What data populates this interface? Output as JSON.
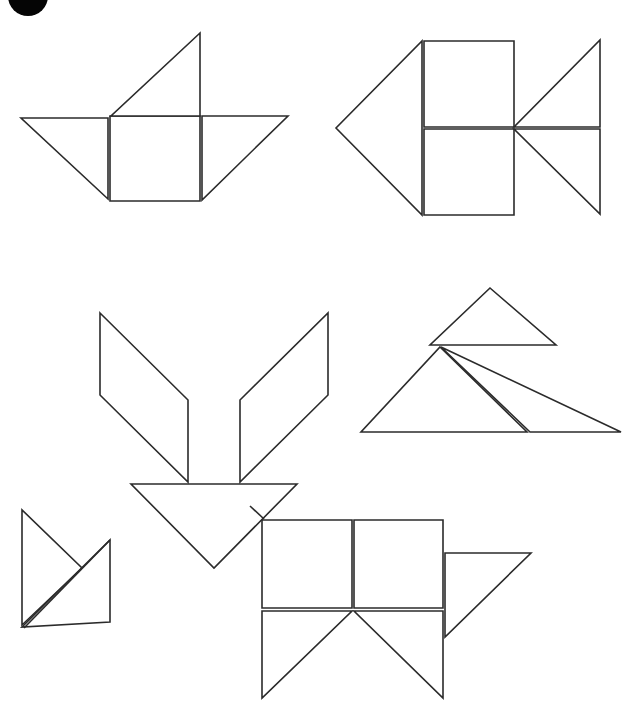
{
  "page": {
    "background_color": "#ffffff",
    "stroke_color": "#2b2b2b",
    "fill_color": "#ffffff",
    "width": 639,
    "height": 702
  },
  "logo": {
    "name": "corner-dot-logo",
    "shape": "circle",
    "color": "#050505",
    "cx": 28,
    "cy": -4,
    "r": 20
  },
  "figures": [
    {
      "id": "figure-top-left",
      "label": "Boat / windmill tangram figure",
      "pieces": [
        {
          "name": "large-triangle-left",
          "type": "triangle",
          "points": "21,118 108,118 108,199"
        },
        {
          "name": "center-square",
          "type": "square",
          "points": "110,116 200,116 200,201 110,201"
        },
        {
          "name": "large-triangle-top",
          "type": "triangle",
          "points": "111,116 200,116 200,33"
        },
        {
          "name": "large-triangle-right",
          "type": "triangle",
          "points": "202,116 288,116 202,200"
        }
      ]
    },
    {
      "id": "figure-top-right",
      "label": "Fish / arrow tangram figure",
      "pieces": [
        {
          "name": "large-triangle-left",
          "type": "triangle",
          "points": "422,41 422,215 336,128"
        },
        {
          "name": "square-upper",
          "type": "square",
          "points": "424,41 514,41 514,127 424,127"
        },
        {
          "name": "square-lower",
          "type": "square",
          "points": "424,129 514,129 514,215 424,215"
        },
        {
          "name": "large-triangle-upper-right",
          "type": "triangle",
          "points": "514,127 600,127 600,40"
        },
        {
          "name": "large-triangle-lower-right",
          "type": "triangle",
          "points": "514,129 600,129 600,214"
        }
      ]
    },
    {
      "id": "figure-middle-left",
      "label": "Rocket / arrow-down tangram figure",
      "pieces": [
        {
          "name": "parallelogram-left",
          "type": "parallelogram",
          "points": "100,313 188,400 188,482 100,395"
        },
        {
          "name": "parallelogram-right",
          "type": "parallelogram",
          "points": "328,313 328,395 240,482 240,400"
        },
        {
          "name": "large-triangle-down",
          "type": "triangle",
          "points": "131,484 297,484 214,568"
        }
      ]
    },
    {
      "id": "figure-middle-right",
      "label": "Mountain / tree tangram figure",
      "pieces": [
        {
          "name": "medium-triangle-top",
          "type": "triangle",
          "points": "490,288 556,345 430,345"
        },
        {
          "name": "large-triangle-left",
          "type": "triangle",
          "points": "440,347 527,432 361,432"
        },
        {
          "name": "large-triangle-right",
          "type": "triangle",
          "points": "441,347 621,432 530,432"
        }
      ]
    },
    {
      "id": "figure-bottom-left",
      "label": "Flag / sail tangram figure",
      "pieces": [
        {
          "name": "large-triangle",
          "type": "triangle",
          "points": "22,510 22,625 82,568"
        },
        {
          "name": "parallelogram",
          "type": "parallelogram",
          "points": "110,540 110,622 22,627 22,627"
        }
      ]
    },
    {
      "id": "figure-bottom-right",
      "label": "Cat / animal tangram figure",
      "pieces": [
        {
          "name": "square-left",
          "type": "square",
          "points": "262,520 352,520 352,608 262,608"
        },
        {
          "name": "square-right",
          "type": "square",
          "points": "354,520 443,520 443,608 354,608"
        },
        {
          "name": "large-triangle-down-left",
          "type": "triangle",
          "points": "262,611 352,611 262,698"
        },
        {
          "name": "large-triangle-down-right",
          "type": "triangle",
          "points": "354,611 443,611 443,698"
        },
        {
          "name": "large-triangle-right-ear",
          "type": "triangle",
          "points": "445,553 531,553 445,637"
        },
        {
          "name": "corner-stroke-top-left",
          "type": "edge",
          "points": "250,506 264,519"
        }
      ]
    }
  ]
}
